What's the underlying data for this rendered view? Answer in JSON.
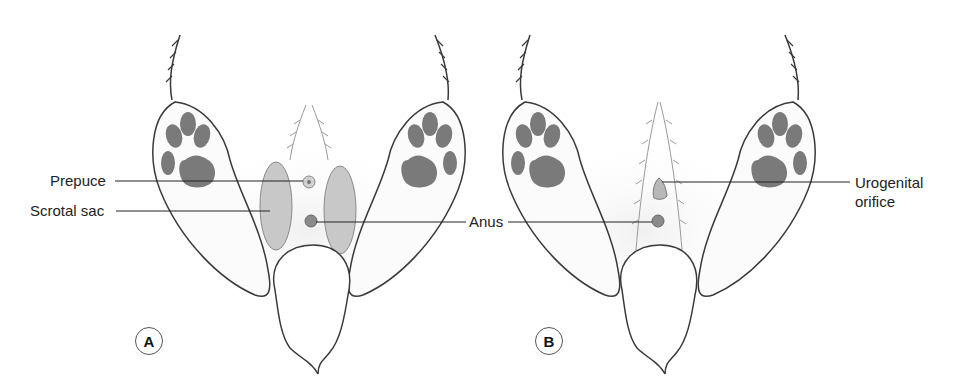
{
  "figure": {
    "panels": [
      {
        "id": "A",
        "badge": "A",
        "labels": {
          "prepuce": "Prepuce",
          "scrotal_sac": "Scrotal sac",
          "anus": "Anus"
        }
      },
      {
        "id": "B",
        "badge": "B",
        "labels": {
          "urogenital_line1": "Urogenital",
          "urogenital_line2": "orifice"
        }
      }
    ],
    "colors": {
      "outline": "#3a3a3a",
      "pad": "#7a7a7a",
      "scrotum": "#c8c8c8",
      "shading": "#ececec",
      "leader_line": "#222222"
    }
  }
}
